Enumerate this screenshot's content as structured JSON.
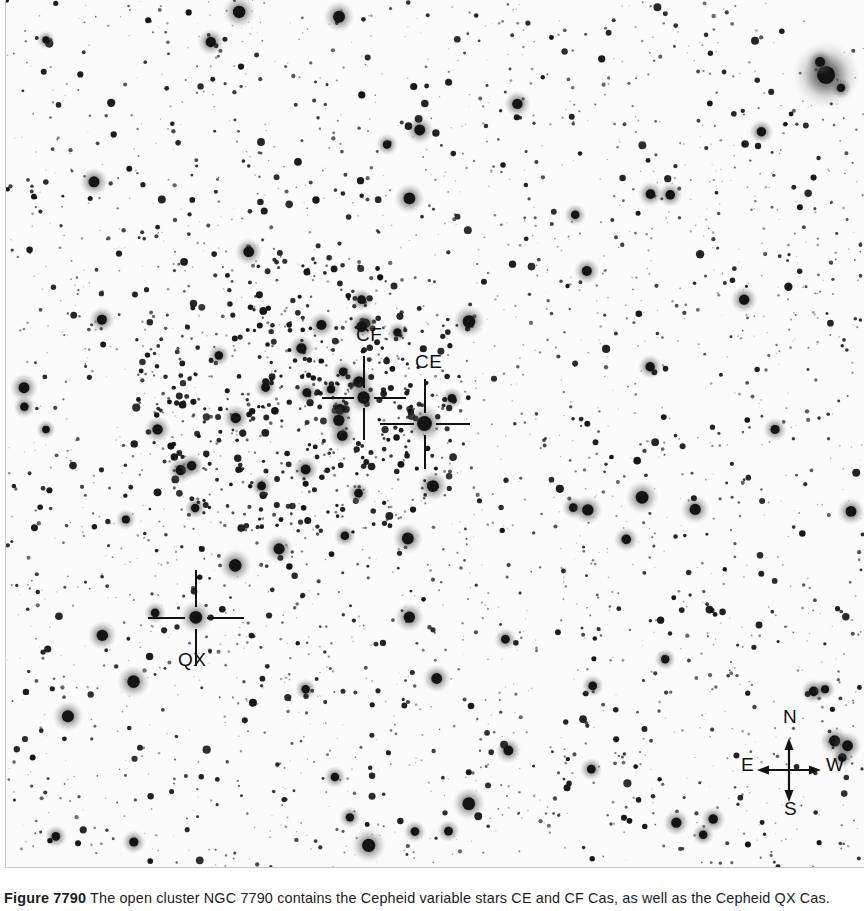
{
  "figure": {
    "number_label": "Figure 7790",
    "caption_text": " The open cluster NGC 7790 contains the Cepheid variable stars CE and CF Cas, as well as the Cepheid QX Cas.",
    "object_name": "NGC 7790"
  },
  "plate": {
    "background_color": "#fbfbfb",
    "star_color": "#111111",
    "border_color": "#c9c9c9",
    "width": 859,
    "height": 868
  },
  "markers": [
    {
      "id": "cf",
      "label": "CF",
      "label_x": 350,
      "label_y": 325,
      "center_x": 358,
      "center_y": 398,
      "arm": 42,
      "gap": 10,
      "thickness": 2
    },
    {
      "id": "ce",
      "label": "CE",
      "label_x": 409,
      "label_y": 352,
      "center_x": 419,
      "center_y": 424,
      "arm": 45,
      "gap": 11,
      "thickness": 2
    },
    {
      "id": "qx",
      "label": "QX",
      "label_x": 172,
      "label_y": 650,
      "center_x": 190,
      "center_y": 618,
      "arm": 48,
      "gap": 11,
      "thickness": 2
    }
  ],
  "compass": {
    "center_x": 783,
    "center_y": 770,
    "arm_length": 28,
    "north_label": "N",
    "south_label": "S",
    "east_label": "E",
    "west_label": "W",
    "north_x": 779,
    "north_y": 713,
    "south_x": 780,
    "south_y": 804,
    "east_x": 732,
    "east_y": 761,
    "west_x": 824,
    "west_y": 761,
    "stroke_color": "#111111"
  }
}
